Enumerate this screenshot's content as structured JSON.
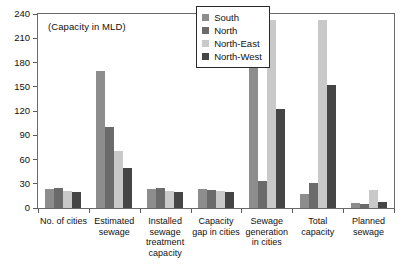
{
  "chart_data": {
    "type": "bar",
    "title": "",
    "annotation": "(Capacity in MLD)",
    "xlabel": "",
    "ylabel": "",
    "ylim": [
      0,
      240
    ],
    "yticks": [
      0,
      30,
      60,
      90,
      120,
      150,
      180,
      210,
      240
    ],
    "grid": false,
    "legend_position": "top-right inside plot",
    "categories": [
      "No. of cities",
      "Estimated sewage",
      "Installed sewage treatment capacity",
      "Capacity gap in cities",
      "Sewage generation in cities",
      "Total capacity",
      "Planned sewage"
    ],
    "category_lines": [
      [
        "No. of cities"
      ],
      [
        "Estimated",
        "sewage"
      ],
      [
        "Installed",
        "sewage",
        "treatment",
        "capacity"
      ],
      [
        "Capacity",
        "gap in cities"
      ],
      [
        "Sewage",
        "generation",
        "in cities"
      ],
      [
        "Total",
        "capacity"
      ],
      [
        "Planned",
        "sewage"
      ]
    ],
    "series": [
      {
        "name": "South",
        "color": "#8d8d8d",
        "values": [
          24,
          169,
          24,
          23,
          180,
          17,
          6
        ]
      },
      {
        "name": "North",
        "color": "#6b6b6b",
        "values": [
          25,
          100,
          25,
          22,
          33,
          31,
          5
        ]
      },
      {
        "name": "North-East",
        "color": "#c9c9c9",
        "values": [
          21,
          70,
          21,
          21,
          232,
          232,
          22
        ]
      },
      {
        "name": "North-West",
        "color": "#454545",
        "values": [
          20,
          50,
          20,
          20,
          122,
          152,
          7
        ]
      }
    ]
  },
  "legend": {
    "entries": [
      {
        "label": "South"
      },
      {
        "label": "North"
      },
      {
        "label": "North-East"
      },
      {
        "label": "North-West"
      }
    ]
  }
}
